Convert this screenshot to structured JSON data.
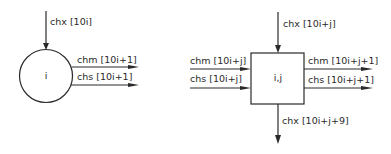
{
  "diagram": {
    "colors": {
      "stroke": "#2a2a2a",
      "background": "#ffffff"
    },
    "left_node": {
      "shape": "circle",
      "label": "i",
      "input_top": "chx [10i]",
      "output_chm": "chm [10i+1]",
      "output_chs": "chs [10i+1]"
    },
    "right_node": {
      "shape": "square",
      "label": "i,j",
      "input_top": "chx [10i+j]",
      "input_chm": "chm [10i+j]",
      "input_chs": "chs [10i+j]",
      "output_chm": "chm [10i+j+1]",
      "output_chs": "chs [10i+j+1]",
      "output_bottom": "chx [10i+j+9]"
    }
  }
}
